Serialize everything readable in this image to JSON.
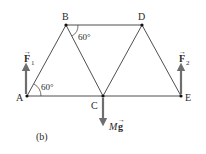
{
  "figure": {
    "caption": "(b)",
    "colors": {
      "member": "#3a3a3a",
      "arrow": "#6e6e6e",
      "joint": "#111111",
      "text": "#2a2a2a"
    },
    "joints": [
      {
        "id": "A",
        "label": "A",
        "x": 27,
        "y": 96
      },
      {
        "id": "B",
        "label": "B",
        "x": 66,
        "y": 25
      },
      {
        "id": "C",
        "label": "C",
        "x": 103,
        "y": 96
      },
      {
        "id": "D",
        "label": "D",
        "x": 142,
        "y": 25
      },
      {
        "id": "E",
        "label": "E",
        "x": 181,
        "y": 96
      }
    ],
    "members": [
      "AB",
      "BC",
      "CD",
      "DE",
      "BD",
      "AC",
      "CE"
    ],
    "angles": [
      {
        "at": "A",
        "label": "60°"
      },
      {
        "at": "B",
        "label": "60°"
      }
    ],
    "forces": [
      {
        "id": "F1",
        "symbol": "F",
        "subscript": "1",
        "at": "A",
        "direction": "up"
      },
      {
        "id": "F2",
        "symbol": "F",
        "subscript": "2",
        "at": "E",
        "direction": "up"
      },
      {
        "id": "Mg",
        "symbol_prefix": "M",
        "symbol": "g",
        "at": "C",
        "direction": "down"
      }
    ]
  }
}
